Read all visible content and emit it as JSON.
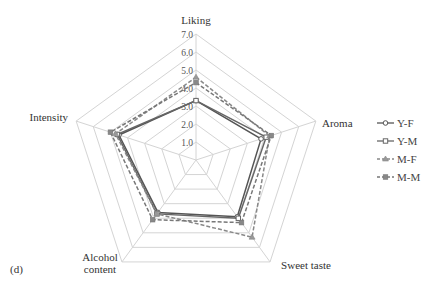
{
  "chart_data": {
    "type": "radar",
    "panel_label": "(d)",
    "axes": [
      "Liking",
      "Aroma",
      "Sweet taste",
      "Alcohol content",
      "Intensity"
    ],
    "ticks": [
      "1.0",
      "2.0",
      "3.0",
      "4.0",
      "5.0",
      "6.0",
      "7.0"
    ],
    "range": [
      0,
      7
    ],
    "grid": true,
    "legend_position": "right",
    "series": [
      {
        "name": "Y-F",
        "values": [
          3.3,
          3.8,
          3.9,
          3.6,
          4.5
        ],
        "color": "#555555",
        "dash": false,
        "marker": "circle"
      },
      {
        "name": "Y-M",
        "values": [
          3.3,
          4.1,
          4.0,
          3.7,
          4.6
        ],
        "color": "#666666",
        "dash": false,
        "marker": "square-open"
      },
      {
        "name": "M-F",
        "values": [
          4.6,
          4.3,
          5.3,
          3.7,
          4.7
        ],
        "color": "#888888",
        "dash": true,
        "marker": "triangle"
      },
      {
        "name": "M-M",
        "values": [
          4.3,
          4.4,
          4.3,
          4.1,
          5.0
        ],
        "color": "#777777",
        "dash": true,
        "marker": "square"
      }
    ]
  }
}
